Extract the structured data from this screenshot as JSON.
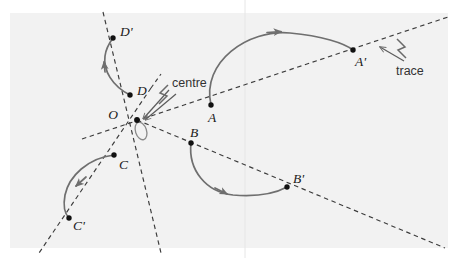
{
  "figure": {
    "background_color": "#f2f2f2",
    "page_color": "#ffffff",
    "plot_area": {
      "x": 10,
      "y": 13,
      "width": 438,
      "height": 235
    },
    "stroke_color": "#6f6f6f",
    "dash_color": "#3c3c3c",
    "point_color": "#111111",
    "label_color": "#1a1a1a"
  },
  "clipped_top_text": {
    "left_fragment": "p p p",
    "right_fragment": "pp"
  },
  "guide": {
    "vertical_line_x": 245,
    "vertical_line_color": "#e4e4e4"
  },
  "points": [
    {
      "id": "O",
      "label": "O",
      "x": 137,
      "y": 120,
      "label_x": 120,
      "label_y": 117,
      "role": "centre-of-rotation"
    },
    {
      "id": "A",
      "label": "A",
      "x": 211,
      "y": 105,
      "label_x": 209,
      "label_y": 118,
      "role": "pre-image"
    },
    {
      "id": "Ap",
      "label": "A'",
      "x": 353,
      "y": 50,
      "label_x": 355,
      "label_y": 65,
      "role": "image"
    },
    {
      "id": "B",
      "label": "B",
      "x": 191,
      "y": 143,
      "label_x": 192,
      "label_y": 137,
      "role": "pre-image"
    },
    {
      "id": "Bp",
      "label": "B'",
      "x": 287,
      "y": 187,
      "label_x": 295,
      "label_y": 182,
      "role": "image"
    },
    {
      "id": "C",
      "label": "C",
      "x": 114,
      "y": 155,
      "label_x": 119,
      "label_y": 168,
      "role": "pre-image"
    },
    {
      "id": "Cp",
      "label": "C'",
      "x": 69,
      "y": 218,
      "label_x": 73,
      "label_y": 229,
      "role": "image"
    },
    {
      "id": "D",
      "label": "D",
      "x": 130,
      "y": 95,
      "label_x": 136,
      "label_y": 94,
      "role": "pre-image"
    },
    {
      "id": "Dp",
      "label": "D'",
      "x": 113,
      "y": 38,
      "label_x": 119,
      "label_y": 35,
      "role": "image"
    }
  ],
  "annotations": [
    {
      "id": "centre",
      "label": "centre",
      "x": 174,
      "y": 90,
      "points_to": "O"
    },
    {
      "id": "trace",
      "label": "trace",
      "x": 403,
      "y": 72,
      "points_to": "ray-A-Aprime"
    }
  ],
  "rays": [
    {
      "id": "ray-D",
      "name": "ray-through-D-Dprime",
      "x1": 103,
      "y1": 12,
      "x2": 160,
      "y2": 252
    },
    {
      "id": "ray-A",
      "name": "ray-through-O-A-Aprime",
      "x1": 83,
      "y1": 139,
      "x2": 448,
      "y2": 18
    },
    {
      "id": "ray-B",
      "name": "ray-through-O-B-Bprime",
      "x1": 137,
      "y1": 120,
      "x2": 444,
      "y2": 247
    },
    {
      "id": "ray-C",
      "name": "ray-through-O-C-Cprime",
      "x1": 150,
      "y1": 90,
      "x2": 40,
      "y2": 252
    }
  ],
  "arcs": [
    {
      "id": "arc-A",
      "name": "arc-A-to-Aprime",
      "from": "A",
      "to": "Ap",
      "arrow_at": "mid"
    },
    {
      "id": "arc-B",
      "name": "arc-B-to-Bprime",
      "from": "B",
      "to": "Bp",
      "arrow_at": "mid"
    },
    {
      "id": "arc-C",
      "name": "arc-C-to-Cprime",
      "from": "C",
      "to": "Cp",
      "arrow_at": "mid"
    },
    {
      "id": "arc-D",
      "name": "arc-D-to-Dprime",
      "from": "D",
      "to": "Dp",
      "arrow_at": "mid"
    }
  ],
  "centre_marker": {
    "name": "small-loop-at-centre",
    "cx": 140,
    "cy": 131,
    "rx": 6,
    "ry": 9,
    "rotation": -20
  }
}
